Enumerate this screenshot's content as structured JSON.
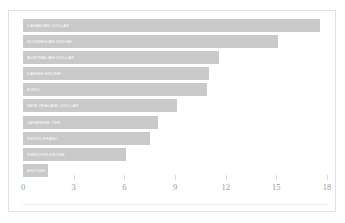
{
  "chart_data": {
    "type": "bar",
    "orientation": "horizontal",
    "title": "",
    "subtitle": "",
    "xlabel": "",
    "ylabel": "",
    "xlim": [
      0,
      18
    ],
    "ylim": null,
    "grid": false,
    "legend": null,
    "legend_position": "none",
    "tick_labels": [
      "0",
      "3",
      "6",
      "9",
      "12",
      "15",
      "18"
    ],
    "tick_values": [
      0,
      3,
      6,
      9,
      12,
      15,
      18
    ],
    "categories": [
      "CANADIAN DOLLAR",
      "NORWEGIAN KRONE",
      "AUSTRALIAN DOLLAR",
      "DANISH KRONE",
      "EURO",
      "NEW ZEALAND DOLLAR",
      "JAPANESE YEN",
      "SWISS FRANC",
      "SWEDISH KRONE",
      "BRITISH POUND"
    ],
    "values": [
      17.6,
      15.1,
      11.6,
      11.0,
      10.9,
      9.1,
      8.0,
      7.5,
      6.1,
      1.5
    ],
    "bars": [
      {
        "label": "CANADIAN DOLLAR",
        "value": 17.6
      },
      {
        "label": "NORWEGIAN KRONE",
        "value": 15.1
      },
      {
        "label": "AUSTRALIAN DOLLAR",
        "value": 11.6
      },
      {
        "label": "DANISH KRONE",
        "value": 11.0
      },
      {
        "label": "EURO",
        "value": 10.9
      },
      {
        "label": "NEW ZEALAND DOLLAR",
        "value": 9.1
      },
      {
        "label": "JAPANESE YEN",
        "value": 8.0
      },
      {
        "label": "SWISS FRANC",
        "value": 7.5
      },
      {
        "label": "SWEDISH KRONE",
        "value": 6.1
      },
      {
        "label": "BRITISH POUND",
        "value": 1.5
      }
    ]
  },
  "style": {
    "bar_color": "#c9c9c9",
    "bar_label_color": "#ffffff",
    "tick_label_color": "#9a9a9a",
    "border_color": "#e2e2e2",
    "background_color": "#ffffff"
  }
}
